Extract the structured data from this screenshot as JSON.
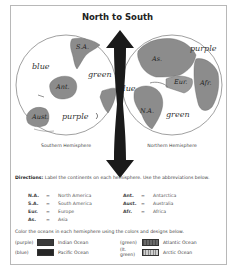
{
  "title": "North to South",
  "southern": {
    "caption": "Southern Hemisphere",
    "labels": {
      "sa": "S.A.",
      "ant": "Ant.",
      "aust": "Aust.",
      "blue": "blue",
      "green": "green",
      "purple": "purple"
    }
  },
  "northern": {
    "caption": "Northern Hemisphere",
    "labels": {
      "as": "As.",
      "eur": "Eur.",
      "afr": "Afr.",
      "na": "N.A.",
      "blue": "blue",
      "green": "green",
      "purple": "purple"
    }
  },
  "directions": {
    "lead": "Directions:",
    "text": " Label the continents on each hemisphere. Use the abbreviations below."
  },
  "abbreviations": [
    [
      {
        "key": "N.A.",
        "eq": "=",
        "val": "North America"
      },
      {
        "key": "Ant.",
        "eq": "=",
        "val": "Antarctica"
      }
    ],
    [
      {
        "key": "S.A.",
        "eq": "=",
        "val": "South America"
      },
      {
        "key": "Aust.",
        "eq": "=",
        "val": "Australia"
      }
    ],
    [
      {
        "key": "Eur.",
        "eq": "=",
        "val": "Europe"
      },
      {
        "key": "Afr.",
        "eq": "=",
        "val": "Africa"
      }
    ],
    [
      {
        "key": "As.",
        "eq": "=",
        "val": "Asia"
      }
    ]
  ],
  "oceans": {
    "intro": "Color the oceans in each hemisphere using the colors and designs below.",
    "items": [
      [
        {
          "color": "(purple)",
          "name": "Indian Ocean"
        },
        {
          "color": "(green)",
          "name": "Atlantic Ocean"
        }
      ],
      [
        {
          "color": "(blue)",
          "name": "Pacific Ocean"
        },
        {
          "color": "(lt. green)",
          "name": "Arctic Ocean"
        }
      ]
    ]
  }
}
